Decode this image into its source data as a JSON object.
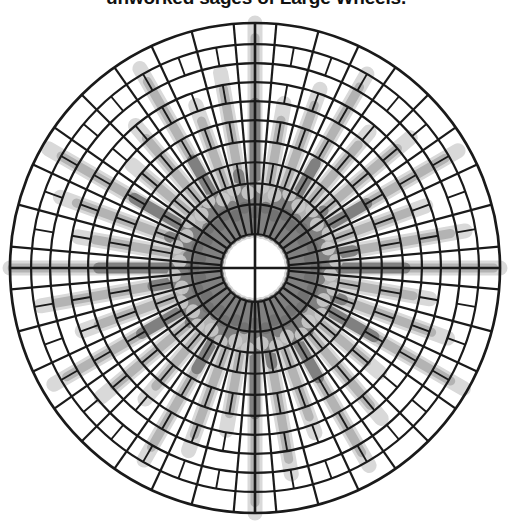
{
  "figure": {
    "title": "unworked sages of Large Wheels.",
    "background": "#ffffff",
    "width": 512,
    "height": 529
  },
  "chart_data": {
    "type": "bar",
    "subtype": "polar-radial-wheel",
    "title": "unworked sages of Large Wheels.",
    "xlabel": "",
    "ylabel": "",
    "grid": true,
    "legend": false,
    "legend_position": "none",
    "center_px": [
      255,
      268
    ],
    "outer_radius_px": 245,
    "inner_hole_radius_px": 34,
    "theta_direction": "counterclockwise",
    "theta_zero_location": "E",
    "rlim": [
      0,
      1
    ],
    "ring_count": 10,
    "ring_radii_fraction": [
      0.14,
      0.24,
      0.34,
      0.44,
      0.54,
      0.63,
      0.72,
      0.81,
      0.9,
      1.0
    ],
    "spoke_count": 36,
    "categories": [
      "s01",
      "s02",
      "s03",
      "s04",
      "s05",
      "s06",
      "s07",
      "s08",
      "s09",
      "s10",
      "s11",
      "s12",
      "s13",
      "s14",
      "s15",
      "s16",
      "s17",
      "s18",
      "s19",
      "s20",
      "s21",
      "s22",
      "s23",
      "s24",
      "s25",
      "s26",
      "s27",
      "s28",
      "s29",
      "s30",
      "s31",
      "s32",
      "s33",
      "s34",
      "s35",
      "s36"
    ],
    "series": [
      {
        "name": "light spokes",
        "color": "#b3b3b3",
        "linewidth_px": 9,
        "cap": "round",
        "values": [
          0.97,
          0.78,
          0.62,
          0.88,
          0.72,
          0.6,
          0.83,
          0.66,
          0.55,
          0.93,
          0.7,
          0.58,
          0.86,
          0.64,
          0.52,
          0.9,
          0.74,
          0.61,
          0.99,
          0.8,
          0.63,
          0.87,
          0.71,
          0.57,
          0.82,
          0.68,
          0.54,
          0.95,
          0.76,
          0.59,
          0.85,
          0.69,
          0.53,
          0.91,
          0.73,
          0.6
        ]
      },
      {
        "name": "dark spokes",
        "color": "#808080",
        "linewidth_px": 11,
        "cap": "round",
        "values": [
          0.55,
          0.31,
          0.17,
          0.45,
          0.26,
          0.14,
          0.41,
          0.22,
          0.12,
          0.62,
          0.29,
          0.15,
          0.43,
          0.2,
          0.11,
          0.5,
          0.27,
          0.16,
          0.58,
          0.33,
          0.18,
          0.46,
          0.24,
          0.13,
          0.39,
          0.21,
          0.12,
          0.53,
          0.3,
          0.16,
          0.44,
          0.23,
          0.12,
          0.49,
          0.28,
          0.15
        ]
      },
      {
        "name": "inner dots",
        "color": "#707070",
        "linewidth_px": 12,
        "cap": "round",
        "values": [
          0.21,
          0.12,
          0.21,
          0.12,
          0.21,
          0.12,
          0.21,
          0.12,
          0.21,
          0.12,
          0.21,
          0.12,
          0.21,
          0.12,
          0.21,
          0.12,
          0.21,
          0.12,
          0.21,
          0.12,
          0.21,
          0.12,
          0.21,
          0.12,
          0.21,
          0.12,
          0.21,
          0.12,
          0.21,
          0.12,
          0.21,
          0.12,
          0.21,
          0.12,
          0.21,
          0.12
        ]
      },
      {
        "name": "faint halo",
        "color": "#d9d9d9",
        "linewidth_px": 15,
        "cap": "round",
        "values": [
          1.0,
          0.85,
          0.7,
          0.95,
          0.8,
          0.68,
          0.9,
          0.74,
          0.63,
          1.0,
          0.78,
          0.66,
          0.93,
          0.72,
          0.6,
          0.97,
          0.82,
          0.69,
          1.0,
          0.87,
          0.71,
          0.94,
          0.79,
          0.65,
          0.89,
          0.76,
          0.62,
          1.0,
          0.83,
          0.67,
          0.92,
          0.77,
          0.61,
          0.98,
          0.81,
          0.68
        ]
      }
    ],
    "grid_style": {
      "line_color": "#1a1a1a",
      "ring_line_width": 2.2,
      "spoke_line_width": 2.2,
      "axis_cross_line_width": 2.6
    }
  }
}
